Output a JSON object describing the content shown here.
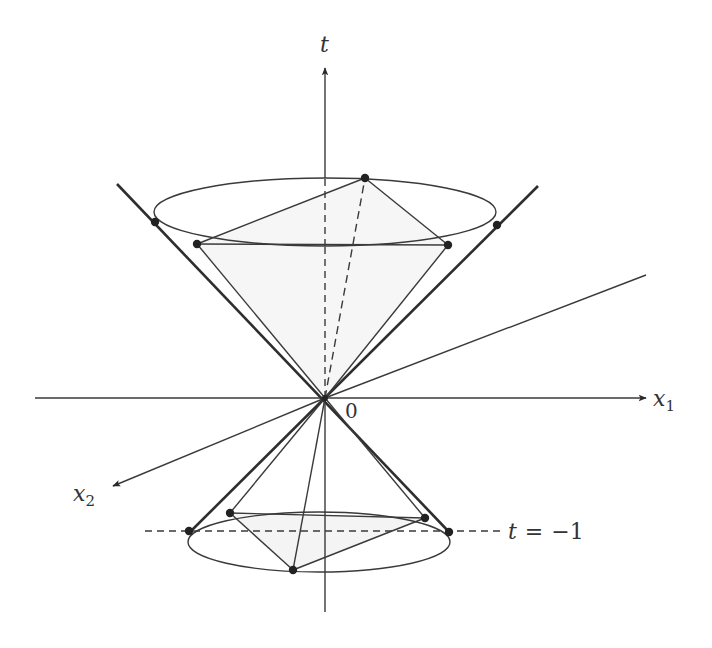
{
  "diagram": {
    "colors": {
      "stroke": "#3a3a3a",
      "cone_edge": "#2e2e2e",
      "fill": "#f3f3f3",
      "dot": "#222222",
      "background": "#ffffff"
    },
    "axes": {
      "t": {
        "label": "t"
      },
      "x1": {
        "label": "x",
        "subscript": "1"
      },
      "x2": {
        "label": "x",
        "subscript": "2"
      },
      "origin": {
        "label": "0"
      }
    },
    "annotations": {
      "plane_label_lhs": "t",
      "plane_label_eq": "=",
      "plane_label_rhs": "−1"
    },
    "upper_cone": {
      "ellipse": {
        "cx": 325,
        "cy": 212,
        "rx": 171,
        "ry": 34
      },
      "points": [
        {
          "name": "left-tangent",
          "x": 155,
          "y": 222
        },
        {
          "name": "right-tangent",
          "x": 497,
          "y": 225
        },
        {
          "name": "back",
          "x": 365,
          "y": 178
        },
        {
          "name": "front-left",
          "x": 197,
          "y": 244
        },
        {
          "name": "front-right",
          "x": 448,
          "y": 245
        }
      ]
    },
    "lower_cone": {
      "ellipse": {
        "cx": 319,
        "cy": 542,
        "rx": 131,
        "ry": 30
      },
      "points": [
        {
          "name": "left-tangent",
          "x": 189,
          "y": 531
        },
        {
          "name": "right-tangent",
          "x": 449,
          "y": 532
        },
        {
          "name": "back-left",
          "x": 230,
          "y": 513
        },
        {
          "name": "back-right",
          "x": 425,
          "y": 518
        },
        {
          "name": "front",
          "x": 293,
          "y": 570
        }
      ]
    }
  }
}
